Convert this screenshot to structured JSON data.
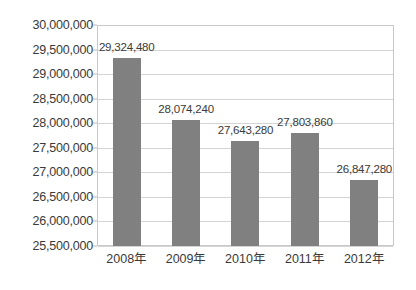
{
  "chart_data": {
    "type": "bar",
    "title": "",
    "subtitle": "",
    "xlabel": "",
    "ylabel": "",
    "categories": [
      "2008年",
      "2009年",
      "2010年",
      "2011年",
      "2012年"
    ],
    "values": [
      29324480,
      28074240,
      27643280,
      27803860,
      26847280
    ],
    "data_labels": [
      "29,324,480",
      "28,074,240",
      "27,643,280",
      "27,803,860",
      "26,847,280"
    ],
    "ylim": [
      25500000,
      30000000
    ],
    "ytick_values": [
      30000000,
      29500000,
      29000000,
      28500000,
      28000000,
      27500000,
      27000000,
      26500000,
      26000000,
      25500000
    ],
    "ytick_labels": [
      "30,000,000",
      "29,500,000",
      "29,000,000",
      "28,500,000",
      "28,000,000",
      "27,500,000",
      "27,000,000",
      "26,500,000",
      "26,000,000",
      "25,500,000"
    ],
    "grid": true,
    "legend": false,
    "legend_position": "none",
    "bar_color": "#808080",
    "gridline_color": "#d5d5d5",
    "frame_color": "#c9c9c9",
    "text_color": "#3a3a3a",
    "background_color": "#ffffff"
  }
}
